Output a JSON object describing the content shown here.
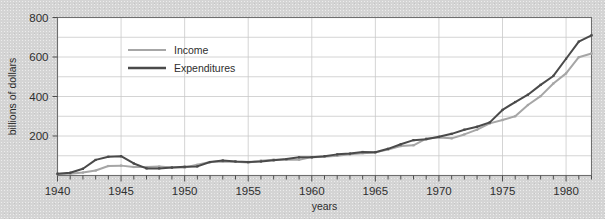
{
  "figure": {
    "title_partial": "",
    "background_color": "#d4d4d4"
  },
  "chart_data": {
    "type": "line",
    "title": "",
    "xlabel": "years",
    "ylabel": "billions of dollars",
    "xlim": [
      1940,
      1982
    ],
    "ylim": [
      0,
      800
    ],
    "yticks": [
      200,
      400,
      600,
      800
    ],
    "ytick_labels": [
      "200",
      "400",
      "600",
      "800"
    ],
    "y_gridline_values": [
      100,
      200,
      300,
      400,
      500,
      600,
      700,
      800
    ],
    "xticks": [
      1940,
      1945,
      1950,
      1955,
      1960,
      1965,
      1970,
      1975,
      1980
    ],
    "xtick_labels": [
      "1940",
      "1945",
      "1950",
      "1955",
      "1960",
      "1965",
      "1970",
      "1975",
      "1980"
    ],
    "x_minor_tick_interval": 1,
    "grid": true,
    "legend_position": "upper-left-inside",
    "x": [
      1940,
      1941,
      1942,
      1943,
      1944,
      1945,
      1946,
      1947,
      1948,
      1949,
      1950,
      1951,
      1952,
      1953,
      1954,
      1955,
      1956,
      1957,
      1958,
      1959,
      1960,
      1961,
      1962,
      1963,
      1964,
      1965,
      1966,
      1967,
      1968,
      1969,
      1970,
      1971,
      1972,
      1973,
      1974,
      1975,
      1976,
      1977,
      1978,
      1979,
      1980,
      1981,
      1982
    ],
    "series": [
      {
        "name": "Income",
        "color": "#a6a6a6",
        "values": [
          7,
          9,
          15,
          25,
          48,
          50,
          43,
          43,
          45,
          41,
          40,
          54,
          68,
          71,
          70,
          66,
          75,
          80,
          80,
          80,
          93,
          95,
          100,
          107,
          113,
          117,
          131,
          149,
          153,
          187,
          193,
          188,
          208,
          232,
          264,
          281,
          300,
          357,
          402,
          466,
          517,
          599,
          618
        ]
      },
      {
        "name": "Expenditures",
        "color": "#4a4a4a",
        "values": [
          9,
          14,
          34,
          79,
          95,
          98,
          61,
          36,
          36,
          40,
          44,
          46,
          68,
          76,
          71,
          68,
          71,
          77,
          83,
          92,
          92,
          98,
          107,
          111,
          119,
          118,
          135,
          158,
          179,
          184,
          196,
          211,
          232,
          247,
          269,
          332,
          372,
          409,
          459,
          504,
          591,
          678,
          710
        ]
      }
    ],
    "annotations": []
  },
  "legend": {
    "items": [
      {
        "label": "Income",
        "color": "#a6a6a6"
      },
      {
        "label": "Expenditures",
        "color": "#4a4a4a"
      }
    ]
  },
  "axes": {
    "y_label": "billions of dollars",
    "x_label": "years"
  }
}
